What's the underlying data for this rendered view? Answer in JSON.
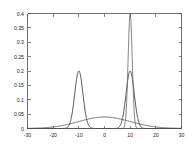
{
  "chart_data": {
    "type": "line",
    "title": "",
    "xlabel": "",
    "ylabel": "",
    "xlim": [
      -30,
      30
    ],
    "ylim": [
      0,
      0.4
    ],
    "grid": false,
    "legend": false,
    "box": true,
    "x_ticks": [
      -30,
      -20,
      -10,
      0,
      10,
      20,
      30
    ],
    "x_tick_labels": [
      "-30",
      "-20",
      "-10",
      "0",
      "10",
      "20",
      "30"
    ],
    "y_ticks": [
      0,
      0.05,
      0.1,
      0.15,
      0.2,
      0.25,
      0.3,
      0.35,
      0.4
    ],
    "y_tick_labels": [
      "0",
      "0.05",
      "0.1",
      "0.15",
      "0.2",
      "0.25",
      "0.3",
      "0.35",
      "0.4"
    ],
    "series": [
      {
        "name": "broad-gaussian",
        "color": "#4d4d4d",
        "mean": 0,
        "sigma": 10,
        "peak": 0.04,
        "x": [
          -30,
          -27,
          -24,
          -21,
          -18,
          -15,
          -12,
          -9,
          -6,
          -3,
          0,
          3,
          6,
          9,
          12,
          15,
          18,
          21,
          24,
          27,
          30
        ],
        "values": [
          0.0044,
          0.0068,
          0.0097,
          0.0131,
          0.0166,
          0.0198,
          0.0225,
          0.0243,
          0.0251,
          0.0253,
          0.0253,
          0.0253,
          0.0251,
          0.0243,
          0.0225,
          0.0198,
          0.0166,
          0.0131,
          0.0097,
          0.0068,
          0.0044
        ]
      },
      {
        "name": "left-medium-peak",
        "color": "#3a3a3a",
        "mean": -10,
        "sigma": 1.6,
        "peak": 0.2,
        "x": [
          -16,
          -15,
          -14,
          -13,
          -12,
          -11,
          -10,
          -9,
          -8,
          -7,
          -6,
          -5,
          -4
        ],
        "values": [
          0.0003,
          0.0016,
          0.0069,
          0.0231,
          0.0604,
          0.1226,
          0.2,
          0.1226,
          0.0604,
          0.0231,
          0.0069,
          0.0016,
          0.0003
        ]
      },
      {
        "name": "right-medium-peak",
        "color": "#3a3a3a",
        "mean": 10,
        "sigma": 1.6,
        "peak": 0.2,
        "x": [
          4,
          5,
          6,
          7,
          8,
          9,
          10,
          11,
          12,
          13,
          14,
          15,
          16
        ],
        "values": [
          0.0003,
          0.0016,
          0.0069,
          0.0231,
          0.0604,
          0.1226,
          0.2,
          0.1226,
          0.0604,
          0.0231,
          0.0069,
          0.0016,
          0.0003
        ]
      },
      {
        "name": "right-tall-peak",
        "color": "#6e6e6e",
        "mean": 10,
        "sigma": 0.8,
        "peak": 0.4,
        "x": [
          7,
          7.5,
          8,
          8.5,
          9,
          9.5,
          10,
          10.5,
          11,
          11.5,
          12,
          12.5,
          13
        ],
        "values": [
          0.0006,
          0.0032,
          0.0138,
          0.0462,
          0.1208,
          0.2453,
          0.4,
          0.2453,
          0.1208,
          0.0462,
          0.0138,
          0.0032,
          0.0006
        ]
      }
    ]
  },
  "axes": {
    "frame_color": "#4d4d4d",
    "background": "#ffffff"
  }
}
